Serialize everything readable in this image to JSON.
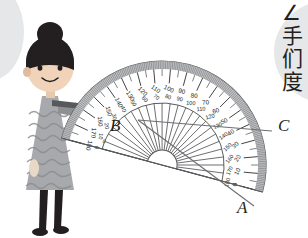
{
  "scene": {
    "title": "Protractor angle measurement illustration",
    "background_color": "#ffffff"
  },
  "bubbles": {
    "left": {
      "name": "left-speech-bubble",
      "color": "#e6e7e8",
      "text": ""
    },
    "right": {
      "name": "right-speech-bubble",
      "color": "#e6e7e8",
      "text": "∠\n手\n们\n度"
    }
  },
  "character": {
    "name": "girl-illustration",
    "hair_color": "#231f20",
    "skin_color": "#e8c9ae",
    "dress_color": "#a7a9ac",
    "leg_color": "#231f20",
    "shoe_color": "#231f20"
  },
  "protractor": {
    "name": "semicircular-protractor",
    "rotation_deg": 15,
    "outer_band_color": "#a7a9ac",
    "line_color": "#58595b",
    "fill_color": "#ffffff",
    "outer_scale": [
      0,
      10,
      20,
      30,
      40,
      50,
      60,
      70,
      80,
      90,
      100,
      110,
      120,
      130,
      140,
      150,
      160,
      170,
      180
    ],
    "inner_scale": [
      180,
      170,
      160,
      150,
      140,
      130,
      120,
      110,
      100,
      90,
      80,
      70,
      60,
      50,
      40,
      30,
      20,
      10,
      0
    ],
    "zero_mark": "0",
    "has_inner_fan": true,
    "fan_ray_count": 24
  },
  "labels": {
    "vertex": "B",
    "ray_lower": "A",
    "ray_upper": "C"
  }
}
